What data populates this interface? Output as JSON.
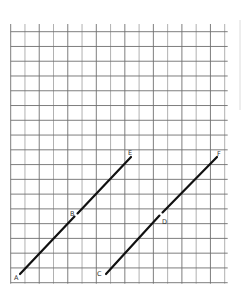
{
  "diagram": {
    "type": "grid-with-parallel-segments",
    "grid": {
      "columns": 15,
      "rows": 17,
      "x_start": 10.7,
      "x_end": 224.7,
      "y_top_stub": 24,
      "y_start": 31.7,
      "y_end": 282.7,
      "line_color": "#6f6f6f"
    },
    "segments": [
      {
        "name": "AE",
        "from": "A",
        "to": "E",
        "x1": 20,
        "y1": 274,
        "x2": 131,
        "y2": 157,
        "midpoint_label": "B",
        "gap_at": {
          "x": 76,
          "y": 215
        }
      },
      {
        "name": "CF",
        "from": "C",
        "to": "F",
        "x1": 106,
        "y1": 274,
        "x2": 217,
        "y2": 157,
        "midpoint_label": "D",
        "gap_at": {
          "x": 161,
          "y": 214
        }
      }
    ],
    "labels": [
      {
        "id": "A",
        "text": "A",
        "x": 14,
        "y": 280
      },
      {
        "id": "B",
        "text": "B",
        "x": 70,
        "y": 216
      },
      {
        "id": "C",
        "text": "C",
        "x": 97,
        "y": 276
      },
      {
        "id": "D",
        "text": "D",
        "x": 162,
        "y": 224
      },
      {
        "id": "E",
        "text": "E",
        "x": 128,
        "y": 155
      },
      {
        "id": "F",
        "text": "F",
        "x": 217,
        "y": 156
      }
    ],
    "segment_color": "#111111"
  }
}
